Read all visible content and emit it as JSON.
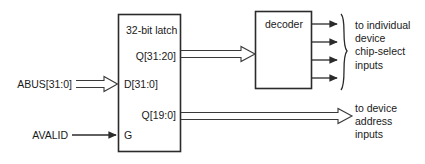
{
  "figure": {
    "background": "#ffffff",
    "line_color": "#2b2b2b",
    "text_color": "#1a1a1a"
  },
  "latch_block": {
    "title": "32-bit latch",
    "ports": {
      "q_high": "Q[31:20]",
      "d": "D[31:0]",
      "q_low": "Q[19:0]",
      "g": "G"
    }
  },
  "decoder_block": {
    "title": "decoder"
  },
  "inputs": {
    "abus": "ABUS[31:0]",
    "avalid": "AVALID"
  },
  "outputs": {
    "chip_select": "to individual\ndevice\nchip-select\ninputs",
    "device_address": "to device\naddress\ninputs"
  }
}
